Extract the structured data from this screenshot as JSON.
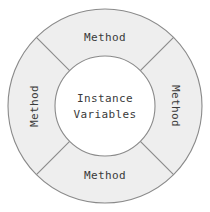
{
  "diagram": {
    "type": "object-structure-donut",
    "center": {
      "line1": "Instance",
      "line2": "Variables"
    },
    "segments": [
      {
        "id": "top",
        "label": "Method",
        "orientation": "horizontal",
        "position": "top"
      },
      {
        "id": "right",
        "label": "Method",
        "orientation": "vertical-down",
        "position": "right"
      },
      {
        "id": "bottom",
        "label": "Method",
        "orientation": "horizontal",
        "position": "bottom"
      },
      {
        "id": "left",
        "label": "Method",
        "orientation": "vertical-up",
        "position": "left"
      }
    ],
    "geometry": {
      "cx": 105,
      "cy": 106,
      "outer_radius": 97,
      "inner_radius": 50,
      "divider_angles_deg": [
        45,
        135,
        225,
        315
      ]
    },
    "colors": {
      "background": "#ffffff",
      "ring_fill": "#eeeeee",
      "center_fill": "#ffffff",
      "stroke": "#8a8a8a",
      "text": "#3a3a3a"
    }
  }
}
